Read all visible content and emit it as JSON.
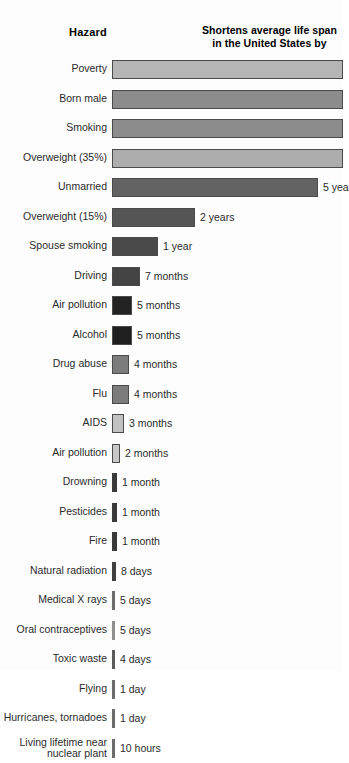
{
  "header": {
    "left_title": "Hazard",
    "right_title_line1": "Shortens average life span",
    "right_title_line2": "in the United States by"
  },
  "chart_data": {
    "type": "bar",
    "title": "Shortens average life span in the United States by",
    "xlabel": "",
    "ylabel": "Hazard",
    "orientation": "horizontal",
    "grid": false,
    "legend": false,
    "note": "The four longest bars (Poverty, Born male, Smoking, Overweight 35%) extend past the right edge of the image and their value labels are not visible. The Unmarried bar's label is clipped to '5 yea'.",
    "categories": [
      "Poverty",
      "Born male",
      "Smoking",
      "Overweight (35%)",
      "Unmarried",
      "Overweight (15%)",
      "Spouse smoking",
      "Driving",
      "Air pollution",
      "Alcohol",
      "Drug abuse",
      "Flu",
      "AIDS",
      "Air pollution",
      "Drowning",
      "Pesticides",
      "Fire",
      "Natural radiation",
      "Medical X rays",
      "Oral contraceptives",
      "Toxic waste",
      "Flying",
      "Hurricanes, tornadoes",
      "Living lifetime near nuclear plant"
    ],
    "value_labels": [
      "",
      "",
      "",
      "",
      "5 yea",
      "2 years",
      "1 year",
      "7 months",
      "5 months",
      "5 months",
      "4 months",
      "4 months",
      "3 months",
      "2 months",
      "1 month",
      "1 month",
      "1 month",
      "8 days",
      "5 days",
      "5 days",
      "4 days",
      "1 day",
      "1 day",
      "10 hours"
    ],
    "values_days": [
      3650,
      2920,
      2555,
      2190,
      1825,
      730,
      365,
      213,
      152,
      152,
      122,
      122,
      91,
      61,
      30,
      30,
      30,
      8,
      5,
      5,
      4,
      1,
      1,
      0.42
    ]
  },
  "rows": [
    {
      "label": "Poverty",
      "value": "",
      "bar_px": 231,
      "color": "#b5b5b5",
      "outlined": true,
      "twoline": false
    },
    {
      "label": "Born male",
      "value": "",
      "bar_px": 231,
      "color": "#8c8c8c",
      "outlined": true,
      "twoline": false
    },
    {
      "label": "Smoking",
      "value": "",
      "bar_px": 231,
      "color": "#8c8c8c",
      "outlined": true,
      "twoline": false
    },
    {
      "label": "Overweight (35%)",
      "value": "",
      "bar_px": 231,
      "color": "#adadad",
      "outlined": true,
      "twoline": false
    },
    {
      "label": "Unmarried",
      "value": "5 yea",
      "bar_px": 206,
      "color": "#636363",
      "outlined": true,
      "twoline": false
    },
    {
      "label": "Overweight (15%)",
      "value": "2 years",
      "bar_px": 83,
      "color": "#555555",
      "outlined": true,
      "twoline": false
    },
    {
      "label": "Spouse smoking",
      "value": "1 year",
      "bar_px": 46,
      "color": "#4a4a4a",
      "outlined": true,
      "twoline": false
    },
    {
      "label": "Driving",
      "value": "7 months",
      "bar_px": 28,
      "color": "#444444",
      "outlined": true,
      "twoline": false
    },
    {
      "label": "Air pollution",
      "value": "5 months",
      "bar_px": 20,
      "color": "#232323",
      "outlined": true,
      "twoline": false
    },
    {
      "label": "Alcohol",
      "value": "5 months",
      "bar_px": 20,
      "color": "#1f1f1f",
      "outlined": true,
      "twoline": false
    },
    {
      "label": "Drug abuse",
      "value": "4 months",
      "bar_px": 17,
      "color": "#7c7c7c",
      "outlined": true,
      "twoline": false
    },
    {
      "label": "Flu",
      "value": "4 months",
      "bar_px": 17,
      "color": "#7c7c7c",
      "outlined": true,
      "twoline": false
    },
    {
      "label": "AIDS",
      "value": "3 months",
      "bar_px": 12,
      "color": "#c2c2c2",
      "outlined": true,
      "twoline": false
    },
    {
      "label": "Air pollution",
      "value": "2 months",
      "bar_px": 8,
      "color": "#c7c7c7",
      "outlined": true,
      "twoline": false
    },
    {
      "label": "Drowning",
      "value": "1 month",
      "bar_px": 5,
      "color": "#3a3a3a",
      "outlined": false,
      "twoline": false
    },
    {
      "label": "Pesticides",
      "value": "1 month",
      "bar_px": 5,
      "color": "#3a3a3a",
      "outlined": false,
      "twoline": false
    },
    {
      "label": "Fire",
      "value": "1 month",
      "bar_px": 5,
      "color": "#3a3a3a",
      "outlined": false,
      "twoline": false
    },
    {
      "label": "Natural radiation",
      "value": "8 days",
      "bar_px": 4,
      "color": "#3f3f3f",
      "outlined": false,
      "twoline": false
    },
    {
      "label": "Medical X rays",
      "value": "5 days",
      "bar_px": 3,
      "color": "#6e6e6e",
      "outlined": false,
      "twoline": false
    },
    {
      "label": "Oral contraceptives",
      "value": "5 days",
      "bar_px": 3,
      "color": "#8f8f8f",
      "outlined": false,
      "twoline": false
    },
    {
      "label": "Toxic waste",
      "value": "4 days",
      "bar_px": 3,
      "color": "#5a5a5a",
      "outlined": false,
      "twoline": false
    },
    {
      "label": "Flying",
      "value": "1 day",
      "bar_px": 3,
      "color": "#6b6b6b",
      "outlined": false,
      "twoline": false
    },
    {
      "label": "Hurricanes, tornadoes",
      "value": "1 day",
      "bar_px": 3,
      "color": "#6b6b6b",
      "outlined": false,
      "twoline": false
    },
    {
      "label": "Living lifetime near\nnuclear plant",
      "value": "10 hours",
      "bar_px": 3,
      "color": "#6b6b6b",
      "outlined": false,
      "twoline": true
    }
  ]
}
